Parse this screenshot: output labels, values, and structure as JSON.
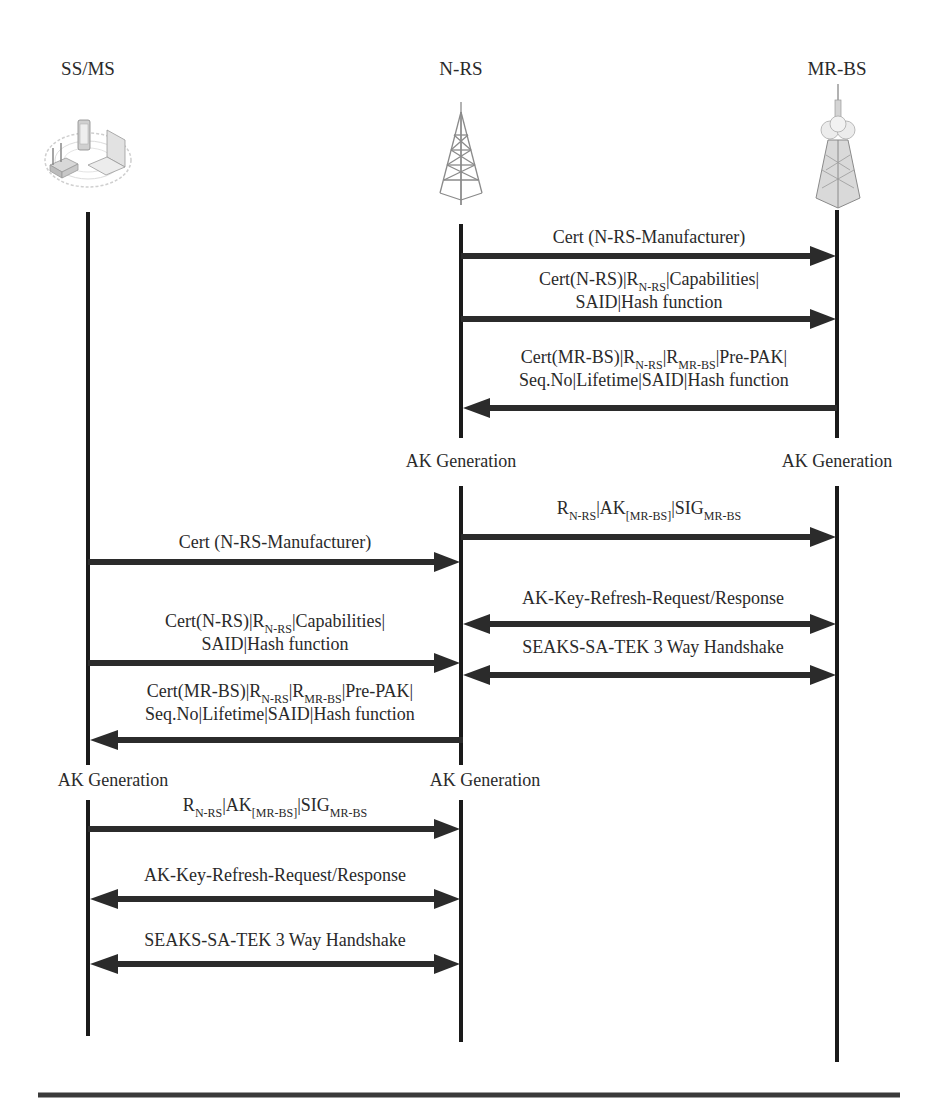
{
  "participants": [
    {
      "id": "ss_ms",
      "label": "SS/MS",
      "icon": "wireless-devices-icon"
    },
    {
      "id": "n_rs",
      "label": "N-RS",
      "icon": "lattice-tower-icon"
    },
    {
      "id": "mr_bs",
      "label": "MR-BS",
      "icon": "base-station-tower-icon"
    }
  ],
  "phase1": {
    "msg1": {
      "from": "N-RS",
      "to": "MR-BS",
      "text": "Cert (N-RS-Manufacturer)"
    },
    "msg2": {
      "from": "N-RS",
      "to": "MR-BS",
      "line1_a": "Cert(N-RS)|R",
      "line1_sub": "N-RS",
      "line1_b": "|Capabilities|",
      "line2": "SAID|Hash function"
    },
    "msg3": {
      "from": "MR-BS",
      "to": "N-RS",
      "line1_a": "Cert(MR-BS)|R",
      "line1_sub1": "N-RS",
      "line1_b": "|R",
      "line1_sub2": "MR-BS",
      "line1_c": "|Pre-PAK|",
      "line2": "Seq.No|Lifetime|SAID|Hash function"
    },
    "ak_gen_left": "AK Generation",
    "ak_gen_right": "AK Generation",
    "msg4": {
      "from": "N-RS",
      "to": "MR-BS",
      "a": "R",
      "sub1": "N-RS",
      "b": "|AK",
      "sub2": "[MR-BS]",
      "c": "|SIG",
      "sub3": "MR-BS"
    },
    "msg5": {
      "between": [
        "N-RS",
        "MR-BS"
      ],
      "text": "AK-Key-Refresh-Request/Response",
      "direction": "bidirectional"
    },
    "msg6": {
      "between": [
        "N-RS",
        "MR-BS"
      ],
      "text": "SEAKS-SA-TEK 3 Way Handshake",
      "direction": "bidirectional"
    }
  },
  "phase2": {
    "msg1": {
      "from": "SS/MS",
      "to": "N-RS",
      "text": "Cert (N-RS-Manufacturer)"
    },
    "msg2": {
      "from": "SS/MS",
      "to": "N-RS",
      "line1_a": "Cert(N-RS)|R",
      "line1_sub": "N-RS",
      "line1_b": "|Capabilities|",
      "line2": "SAID|Hash function"
    },
    "msg3": {
      "from": "N-RS",
      "to": "SS/MS",
      "line1_a": "Cert(MR-BS)|R",
      "line1_sub1": "N-RS",
      "line1_b": "|R",
      "line1_sub2": "MR-BS",
      "line1_c": "|Pre-PAK|",
      "line2": "Seq.No|Lifetime|SAID|Hash function"
    },
    "ak_gen_left": "AK Generation",
    "ak_gen_right": "AK Generation",
    "msg4": {
      "from": "SS/MS",
      "to": "N-RS",
      "a": "R",
      "sub1": "N-RS",
      "b": "|AK",
      "sub2": "[MR-BS]",
      "c": "|SIG",
      "sub3": "MR-BS"
    },
    "msg5": {
      "between": [
        "SS/MS",
        "N-RS"
      ],
      "text": "AK-Key-Refresh-Request/Response",
      "direction": "bidirectional"
    },
    "msg6": {
      "between": [
        "SS/MS",
        "N-RS"
      ],
      "text": "SEAKS-SA-TEK 3 Way Handshake",
      "direction": "bidirectional"
    }
  },
  "colors": {
    "line": "#1a1a1a",
    "arrow": "#2b2b2b",
    "text": "#2a2a2a",
    "background": "#ffffff"
  }
}
